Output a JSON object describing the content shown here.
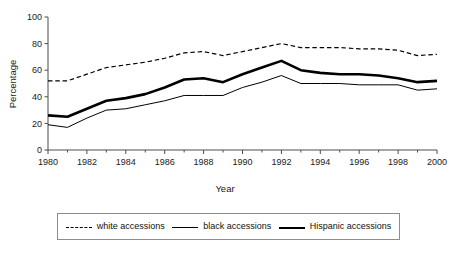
{
  "chart_data": {
    "type": "line",
    "title": "",
    "subtitle": "",
    "xlabel": "Year",
    "ylabel": "Percentage",
    "xlim": [
      1980,
      2000
    ],
    "ylim": [
      0,
      100
    ],
    "grid": false,
    "legend_position": "bottom",
    "x": [
      1980,
      1981,
      1982,
      1983,
      1984,
      1985,
      1986,
      1987,
      1988,
      1989,
      1990,
      1991,
      1992,
      1993,
      1994,
      1995,
      1996,
      1997,
      1998,
      1999,
      2000
    ],
    "xtick_labels": [
      "1980",
      "1982",
      "1984",
      "1986",
      "1988",
      "1990",
      "1992",
      "1994",
      "1996",
      "1998",
      "2000"
    ],
    "xtick_values": [
      1980,
      1982,
      1984,
      1986,
      1988,
      1990,
      1992,
      1994,
      1996,
      1998,
      2000
    ],
    "ytick_labels": [
      "0",
      "20",
      "40",
      "60",
      "80",
      "100"
    ],
    "ytick_values": [
      0,
      20,
      40,
      60,
      80,
      100
    ],
    "series": [
      {
        "name": "white accessions",
        "style": "dashed",
        "width": 1.2,
        "color": "#000000",
        "values": [
          52,
          52,
          57,
          62,
          64,
          66,
          69,
          73,
          74,
          71,
          74,
          77,
          80,
          77,
          77,
          77,
          76,
          76,
          75,
          71,
          72
        ]
      },
      {
        "name": "black accessions",
        "style": "solid-thin",
        "width": 1.0,
        "color": "#000000",
        "values": [
          19,
          17,
          24,
          30,
          31,
          34,
          37,
          41,
          41,
          41,
          47,
          51,
          56,
          50,
          50,
          50,
          49,
          49,
          49,
          45,
          46
        ]
      },
      {
        "name": "Hispanic accessions",
        "style": "solid-thick",
        "width": 2.6,
        "color": "#000000",
        "values": [
          26,
          25,
          31,
          37,
          39,
          42,
          47,
          53,
          54,
          51,
          57,
          62,
          67,
          60,
          58,
          57,
          57,
          56,
          54,
          51,
          52
        ]
      }
    ]
  },
  "axes": {
    "ylabel": "Percentage",
    "xlabel": "Year"
  },
  "legend": {
    "entries": [
      {
        "label": "white accessions",
        "style": "dashed"
      },
      {
        "label": "black accessions",
        "style": "thin"
      },
      {
        "label": "Hispanic accessions",
        "style": "thick"
      }
    ]
  },
  "colors": {
    "ink": "#000000",
    "axis": "#4d4d4d",
    "legend_border": "#8d8d8d",
    "background": "#ffffff"
  }
}
